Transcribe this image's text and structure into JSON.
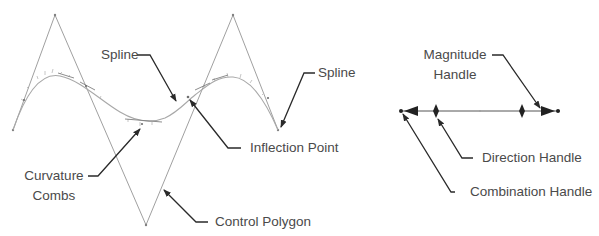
{
  "diagram": {
    "type": "spline-annotation",
    "left_figure": {
      "labels": {
        "spline_top": "Spline",
        "spline_right": "Spline",
        "inflection_point": "Inflection Point",
        "curvature_combs_line1": "Curvature",
        "curvature_combs_line2": "Combs",
        "control_polygon": "Control Polygon"
      }
    },
    "right_figure": {
      "labels": {
        "magnitude_handle_line1": "Magnitude",
        "magnitude_handle_line2": "Handle",
        "direction_handle": "Direction Handle",
        "combination_handle": "Combination Handle"
      }
    },
    "colors": {
      "control_polygon": "#a0a0a0",
      "spline": "#a8a8a8",
      "leader_arrow": "#2a2a2a",
      "label_text": "#4a4a4a",
      "handle": "#333333"
    }
  }
}
